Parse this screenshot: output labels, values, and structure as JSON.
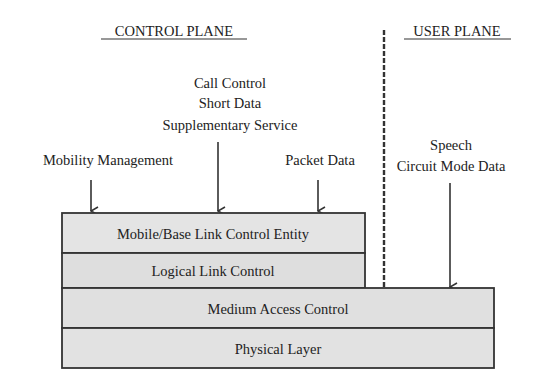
{
  "diagram": {
    "headings": {
      "control_plane": "CONTROL PLANE",
      "user_plane": "USER PLANE"
    },
    "inputs": {
      "mobility": "Mobility Management",
      "call_control": [
        "Call Control",
        "Short Data",
        "Supplementary Service"
      ],
      "packet": "Packet Data",
      "speech": [
        "Speech",
        "Circuit Mode Data"
      ]
    },
    "layers": {
      "mle": "Mobile/Base Link Control Entity",
      "llc": "Logical Link Control",
      "mac": "Medium Access Control",
      "phy": "Physical Layer"
    },
    "colors": {
      "box_fill": "#e2e2e2",
      "stroke": "#333333",
      "text": "#222222"
    }
  }
}
